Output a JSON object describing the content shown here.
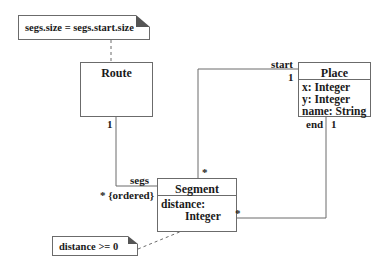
{
  "notes": {
    "route_constraint": "segs.size = segs.start.size",
    "segment_constraint": "distance >= 0"
  },
  "classes": {
    "route": {
      "name": "Route",
      "attributes": []
    },
    "place": {
      "name": "Place",
      "attributes": [
        "x: Integer",
        "y: Integer",
        "name: String"
      ]
    },
    "segment": {
      "name": "Segment",
      "attributes": [
        "distance:",
        "Integer"
      ]
    }
  },
  "associations": {
    "route_segs": {
      "route_mult": "1",
      "role": "segs",
      "segment_mult": "* {ordered}"
    },
    "segment_start": {
      "role": "start",
      "place_mult": "1",
      "segment_mult": "*"
    },
    "segment_end": {
      "role": "end",
      "place_mult": "1",
      "segment_mult": "*"
    }
  },
  "colors": {
    "line": "#6b6b6b",
    "fold": "#555555",
    "text": "#1a1a1a"
  }
}
